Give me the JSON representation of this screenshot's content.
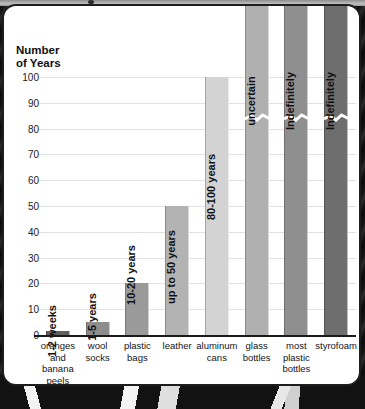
{
  "figure": {
    "axis_title": "Number\nof Years",
    "card_border_color": "#1d1d1d"
  },
  "chart_data": {
    "type": "bar",
    "title": "",
    "subtitle": "",
    "xlabel": "",
    "ylabel": "Number of Years",
    "ylim": [
      0,
      100
    ],
    "yticks": [
      0,
      10,
      20,
      30,
      40,
      50,
      60,
      70,
      80,
      90,
      100
    ],
    "ytick_labels": [
      "0",
      "10",
      "20",
      "30",
      "40",
      "50",
      "60",
      "70",
      "80",
      "90",
      "100"
    ],
    "grid": true,
    "grid_axis": "y",
    "legend": "none",
    "categories": [
      "oranges\nand\nbanana\npeels",
      "wool\nsocks",
      "plastic\nbags",
      "leather",
      "aluminum\ncans",
      "glass\nbottles",
      "most\nplastic\nbottles",
      "styrofoam"
    ],
    "values": [
      1.5,
      5,
      20,
      50,
      100,
      100,
      100,
      100
    ],
    "bar_labels": [
      "1-2 weeks",
      "1-5 years",
      "10-20 years",
      "up to 50 years",
      "80-100 years",
      "uncertain",
      "Indefinitely",
      "Indefinitely"
    ],
    "bar_colors": [
      "#606060",
      "#8d8d8d",
      "#9a9a9a",
      "#b3b3b3",
      "#d3d3d3",
      "#b0b0b0",
      "#8f8f8f",
      "#6e6e6e"
    ],
    "truncated_bars": [
      5,
      6,
      7
    ],
    "truncation_note": "axis break",
    "annotations": [
      {
        "category": "oranges and banana peels",
        "text": "1-2 weeks"
      },
      {
        "category": "wool socks",
        "text": "1-5 years"
      },
      {
        "category": "plastic bags",
        "text": "10-20 years"
      },
      {
        "category": "leather",
        "text": "up to 50 years"
      },
      {
        "category": "aluminum cans",
        "text": "80-100 years"
      },
      {
        "category": "glass bottles",
        "text": "uncertain"
      },
      {
        "category": "most plastic bottles",
        "text": "Indefinitely"
      },
      {
        "category": "styrofoam",
        "text": "Indefinitely"
      }
    ]
  }
}
